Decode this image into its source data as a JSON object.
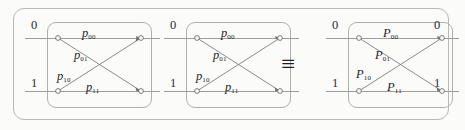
{
  "figure": {
    "type": "butterfly-transition-diagram",
    "equivalence_symbol": "≡",
    "wire_labels": {
      "top": "0",
      "bottom": "1"
    },
    "blocks": [
      {
        "id": "block-1",
        "symbol_case": "lower",
        "labels": {
          "top": {
            "var": "p",
            "sub": "00"
          },
          "upper_diagonal": {
            "var": "p",
            "sub": "01"
          },
          "lower_diagonal": {
            "var": "p",
            "sub": "10"
          },
          "bottom": {
            "var": "p",
            "sub": "11"
          }
        },
        "left_digits": {
          "top": "0",
          "bottom": "1"
        }
      },
      {
        "id": "block-2",
        "symbol_case": "lower",
        "labels": {
          "top": {
            "var": "p",
            "sub": "00"
          },
          "upper_diagonal": {
            "var": "p",
            "sub": "01"
          },
          "lower_diagonal": {
            "var": "p",
            "sub": "10"
          },
          "bottom": {
            "var": "p",
            "sub": "11"
          }
        },
        "left_digits": {
          "top": "0",
          "bottom": "1"
        }
      },
      {
        "id": "block-3",
        "symbol_case": "upper",
        "labels": {
          "top": {
            "var": "P",
            "sub": "00"
          },
          "upper_diagonal": {
            "var": "P",
            "sub": "01"
          },
          "lower_diagonal": {
            "var": "P",
            "sub": "10"
          },
          "bottom": {
            "var": "P",
            "sub": "11"
          }
        },
        "left_digits": {
          "top": "0",
          "bottom": "1"
        }
      }
    ],
    "right_digits": {
      "top": "0",
      "bottom": "1"
    },
    "colors": {
      "background": "#fbfbf9",
      "frame": "#b9b9b4",
      "box": "#b0b0ab",
      "wire": "#9e9e99",
      "diagonal": "#7e7e7a",
      "text": "#242424"
    }
  }
}
